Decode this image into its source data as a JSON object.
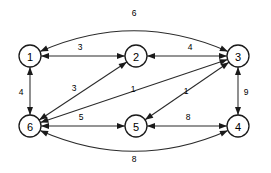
{
  "figure": {
    "kind": "weighted-directed-graph",
    "node_radius": 11,
    "line_color": "#2b2b2b",
    "node_stroke_color": "#1a1a1a",
    "node_fill_color": "#ffffff",
    "label_color": "#000000",
    "background_color": "#ffffff"
  },
  "nodes": [
    {
      "id": "1",
      "label": "1",
      "x": 30,
      "y": 56
    },
    {
      "id": "2",
      "label": "2",
      "x": 136,
      "y": 56
    },
    {
      "id": "3",
      "label": "3",
      "x": 238,
      "y": 56
    },
    {
      "id": "4",
      "label": "4",
      "x": 238,
      "y": 126
    },
    {
      "id": "5",
      "label": "5",
      "x": 136,
      "y": 126
    },
    {
      "id": "6",
      "label": "6",
      "x": 30,
      "y": 126
    }
  ],
  "edges": [
    {
      "id": "e-1-3-top",
      "from": "3",
      "to": "1",
      "weight": "6",
      "shape": "curve-top",
      "arrows": "both",
      "label_x": 134,
      "label_y": 13
    },
    {
      "id": "e-1-2",
      "from": "1",
      "to": "2",
      "weight": "3",
      "shape": "straight",
      "arrows": "both",
      "label_x": 80,
      "label_y": 47
    },
    {
      "id": "e-2-3",
      "from": "2",
      "to": "3",
      "weight": "4",
      "shape": "straight",
      "arrows": "both",
      "label_x": 190,
      "label_y": 47
    },
    {
      "id": "e-1-6",
      "from": "1",
      "to": "6",
      "weight": "4",
      "shape": "straight",
      "arrows": "both",
      "label_x": 21,
      "label_y": 92
    },
    {
      "id": "e-3-4",
      "from": "3",
      "to": "4",
      "weight": "9",
      "shape": "straight",
      "arrows": "both",
      "label_x": 246,
      "label_y": 92
    },
    {
      "id": "e-6-2",
      "from": "6",
      "to": "2",
      "weight": "3",
      "shape": "straight",
      "arrows": "both",
      "label_x": 74,
      "label_y": 88
    },
    {
      "id": "e-6-3",
      "from": "6",
      "to": "3",
      "weight": "1",
      "shape": "straight",
      "arrows": "both",
      "label_x": 133,
      "label_y": 89
    },
    {
      "id": "e-5-3",
      "from": "5",
      "to": "3",
      "weight": "1",
      "shape": "straight",
      "arrows": "both",
      "label_x": 186,
      "label_y": 91
    },
    {
      "id": "e-6-5",
      "from": "6",
      "to": "5",
      "weight": "5",
      "shape": "straight",
      "arrows": "both",
      "label_x": 81,
      "label_y": 117
    },
    {
      "id": "e-5-4",
      "from": "5",
      "to": "4",
      "weight": "8",
      "shape": "straight",
      "arrows": "both",
      "label_x": 188,
      "label_y": 117
    },
    {
      "id": "e-6-4-bottom",
      "from": "4",
      "to": "6",
      "weight": "8",
      "shape": "curve-bottom",
      "arrows": "both",
      "label_x": 134,
      "label_y": 159
    }
  ]
}
